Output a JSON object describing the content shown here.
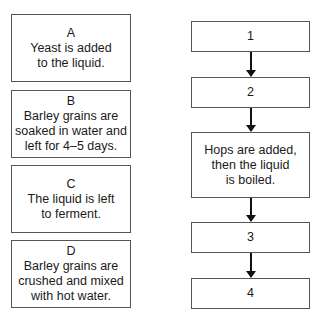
{
  "statements": [
    {
      "letter": "A",
      "lines": [
        "Yeast is added",
        "to the liquid."
      ]
    },
    {
      "letter": "B",
      "lines": [
        "Barley grains are",
        "soaked in water and",
        "left for 4–5 days."
      ]
    },
    {
      "letter": "C",
      "lines": [
        "The liquid is left",
        "to ferment."
      ]
    },
    {
      "letter": "D",
      "lines": [
        "Barley grains are",
        "crushed and mixed",
        "with hot water."
      ]
    }
  ],
  "flowchart": {
    "steps": [
      {
        "label": "1"
      },
      {
        "label": "2"
      },
      {
        "lines": [
          "Hops are added,",
          "then the liquid",
          "is boiled."
        ]
      },
      {
        "label": "3"
      },
      {
        "label": "4"
      }
    ]
  }
}
